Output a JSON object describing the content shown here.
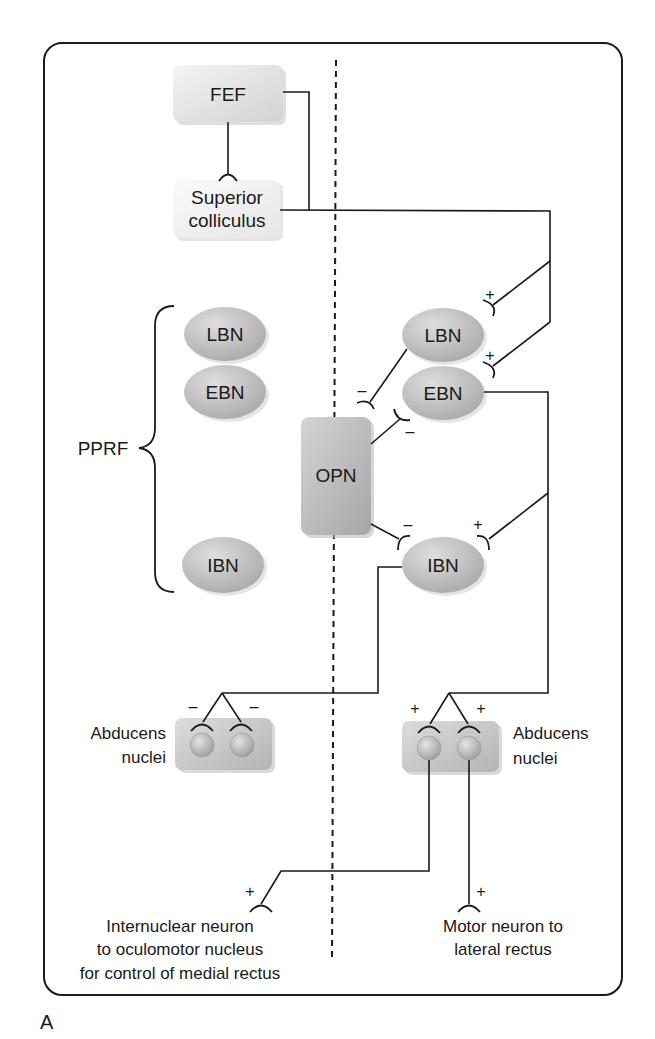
{
  "figure_label": "A",
  "colors": {
    "frame": "#1a1a1a",
    "wire": "#1a1a1a",
    "node_ellipse": "#bdbdbd",
    "box_light": "#ececec",
    "box_dark": "#b3b3b3",
    "background": "#ffffff"
  },
  "nodes": {
    "fef": "FEF",
    "superior_colliculus_line1": "Superior",
    "superior_colliculus_line2": "colliculus",
    "left_lbn": "LBN",
    "left_ebn": "EBN",
    "left_ibn": "IBN",
    "right_lbn": "LBN",
    "right_ebn": "EBN",
    "right_ibn": "IBN",
    "opn": "OPN"
  },
  "labels": {
    "pprf": "PPRF",
    "left_abducens_line1": "Abducens",
    "left_abducens_line2": "nuclei",
    "right_abducens_line1": "Abducens",
    "right_abducens_line2": "nuclei",
    "internuclear_line1": "Internuclear neuron",
    "internuclear_line2": "to oculomotor nucleus",
    "internuclear_line3": "for control of medial rectus",
    "motor_line1": "Motor neuron to",
    "motor_line2": "lateral rectus"
  },
  "signs": {
    "lbn_right_input": "+",
    "ebn_right_input": "+",
    "opn_to_lbn": "–",
    "opn_to_ebn": "–",
    "opn_to_ibn": "–",
    "ibn_right_input": "+",
    "left_abducens_a": "–",
    "left_abducens_b": "–",
    "right_abducens_a": "+",
    "right_abducens_b": "+",
    "internuclear_out": "+",
    "motor_out": "+"
  },
  "connections": [
    {
      "from": "FEF",
      "to": "Superior colliculus",
      "type": "excitatory"
    },
    {
      "from": "FEF",
      "to": "right LBN/EBN via SC path",
      "type": "excitatory"
    },
    {
      "from": "Superior colliculus",
      "to": "right LBN",
      "sign": "+"
    },
    {
      "from": "Superior colliculus",
      "to": "right EBN",
      "sign": "+"
    },
    {
      "from": "Superior colliculus",
      "to": "right IBN",
      "sign": "+"
    },
    {
      "from": "right LBN",
      "to": "OPN",
      "sign": "-"
    },
    {
      "from": "OPN",
      "to": "right EBN",
      "sign": "-"
    },
    {
      "from": "OPN",
      "to": "right IBN",
      "sign": "-"
    },
    {
      "from": "right EBN",
      "to": "right Abducens nuclei",
      "sign": "+"
    },
    {
      "from": "right IBN",
      "to": "left Abducens nuclei",
      "sign": "-"
    },
    {
      "from": "right Abducens nuclei",
      "to": "Internuclear neuron",
      "sign": "+"
    },
    {
      "from": "right Abducens nuclei",
      "to": "Motor neuron to lateral rectus",
      "sign": "+"
    }
  ]
}
